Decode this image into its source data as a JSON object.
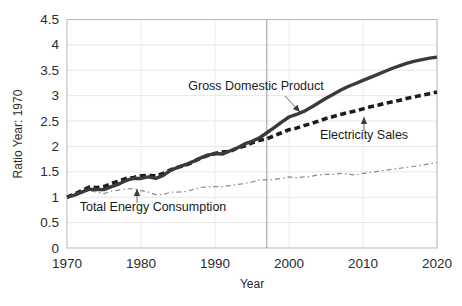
{
  "chart_data": {
    "type": "line",
    "title": "",
    "xlabel": "Year",
    "ylabel": "Ratio Year: 1970",
    "xlim": [
      1970,
      2020
    ],
    "ylim": [
      0,
      4.5
    ],
    "grid": true,
    "legend_position": "inline-annotations",
    "xticks": [
      "1970",
      "1980",
      "1990",
      "2000",
      "2010",
      "2020"
    ],
    "xtick_values": [
      1970,
      1980,
      1990,
      2000,
      2010,
      2020
    ],
    "yticks": [
      "0",
      "0.5",
      "1",
      "1.5",
      "2",
      "2.5",
      "3",
      "3.5",
      "4",
      "4.5"
    ],
    "ytick_values": [
      0,
      0.5,
      1,
      1.5,
      2,
      2.5,
      3,
      3.5,
      4,
      4.5
    ],
    "x": [
      1970,
      1971,
      1972,
      1973,
      1974,
      1975,
      1976,
      1977,
      1978,
      1979,
      1980,
      1981,
      1982,
      1983,
      1984,
      1985,
      1986,
      1987,
      1988,
      1989,
      1990,
      1991,
      1992,
      1993,
      1994,
      1995,
      1996,
      1997,
      1998,
      1999,
      2000,
      2001,
      2002,
      2003,
      2004,
      2005,
      2006,
      2007,
      2008,
      2009,
      2010,
      2011,
      2012,
      2013,
      2014,
      2015,
      2016,
      2017,
      2018,
      2019,
      2020
    ],
    "series": [
      {
        "name": "Gross Domestic Product",
        "style": "solid",
        "color": "#3a3a3a",
        "width": 3.4,
        "values": [
          1.0,
          1.04,
          1.1,
          1.16,
          1.15,
          1.15,
          1.21,
          1.26,
          1.33,
          1.37,
          1.37,
          1.4,
          1.37,
          1.43,
          1.53,
          1.59,
          1.64,
          1.7,
          1.77,
          1.83,
          1.86,
          1.85,
          1.91,
          1.97,
          2.05,
          2.1,
          2.17,
          2.27,
          2.37,
          2.48,
          2.58,
          2.63,
          2.69,
          2.77,
          2.86,
          2.95,
          3.03,
          3.11,
          3.18,
          3.24,
          3.3,
          3.36,
          3.42,
          3.48,
          3.54,
          3.59,
          3.64,
          3.68,
          3.71,
          3.74,
          3.76
        ]
      },
      {
        "name": "Electricity Sales",
        "style": "dashed",
        "color": "#1c1c1c",
        "width": 3.6,
        "values": [
          1.0,
          1.06,
          1.13,
          1.2,
          1.19,
          1.21,
          1.27,
          1.32,
          1.37,
          1.39,
          1.42,
          1.43,
          1.42,
          1.47,
          1.54,
          1.59,
          1.63,
          1.69,
          1.77,
          1.82,
          1.86,
          1.89,
          1.9,
          1.97,
          2.01,
          2.07,
          2.12,
          2.15,
          2.21,
          2.27,
          2.33,
          2.36,
          2.41,
          2.45,
          2.5,
          2.55,
          2.59,
          2.63,
          2.67,
          2.7,
          2.74,
          2.78,
          2.81,
          2.85,
          2.88,
          2.91,
          2.95,
          2.98,
          3.01,
          3.04,
          3.07
        ]
      },
      {
        "name": "Total Energy Consumption",
        "style": "dash-dot",
        "color": "#8a8a8a",
        "width": 1.2,
        "values": [
          1.0,
          1.04,
          1.09,
          1.13,
          1.1,
          1.07,
          1.12,
          1.14,
          1.16,
          1.17,
          1.13,
          1.1,
          1.05,
          1.05,
          1.1,
          1.1,
          1.11,
          1.15,
          1.19,
          1.21,
          1.21,
          1.21,
          1.23,
          1.25,
          1.27,
          1.3,
          1.34,
          1.34,
          1.35,
          1.37,
          1.4,
          1.38,
          1.4,
          1.41,
          1.44,
          1.45,
          1.45,
          1.47,
          1.45,
          1.44,
          1.47,
          1.49,
          1.51,
          1.53,
          1.55,
          1.57,
          1.59,
          1.61,
          1.63,
          1.66,
          1.68
        ]
      }
    ],
    "annotations": [
      {
        "label": "Gross Domestic Product",
        "target_series": "Gross Domestic Product"
      },
      {
        "label": "Electricity Sales",
        "target_series": "Electricity Sales"
      },
      {
        "label": "Total Energy Consumption",
        "target_series": "Total Energy Consumption"
      }
    ],
    "reference_line": {
      "x": 1997,
      "color": "#9a9a9a"
    }
  }
}
